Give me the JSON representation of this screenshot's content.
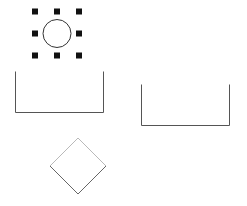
{
  "canvas": {
    "width": 247,
    "height": 206,
    "background_color": "#ffffff",
    "label": "drawing-canvas"
  },
  "colors": {
    "shape_stroke": "#555555",
    "circle_stroke": "#333333",
    "handle_fill": "#111111",
    "diamond_stroke_dark": "#666666",
    "diamond_stroke_light": "#b9b9b9"
  },
  "shapes": [
    {
      "id": "circle-selected",
      "name": "circle-shape",
      "type": "circle",
      "selected": true,
      "cx": 57,
      "cy": 33.5,
      "r": 14,
      "stroke": "#333333",
      "stroke_width": 1,
      "fill": "none"
    },
    {
      "id": "u-shape-left",
      "name": "open-top-rectangle-left",
      "type": "polyline",
      "selected": false,
      "points": "15.5,71.5 15.5,112.5 103.5,112.5 103.5,71.5",
      "stroke": "#555555",
      "stroke_width": 1,
      "fill": "none"
    },
    {
      "id": "u-shape-right",
      "name": "open-top-rectangle-right",
      "type": "polyline",
      "selected": false,
      "points": "141.5,84.5 141.5,125.5 229.5,125.5 229.5,84.5",
      "stroke": "#555555",
      "stroke_width": 1,
      "fill": "none"
    },
    {
      "id": "diamond",
      "name": "diamond-shape",
      "type": "polygon",
      "selected": false,
      "cx": 78,
      "cy": 166,
      "half_diagonal": 28,
      "rotation_deg": 45,
      "points": "78,138 106,166 78,194 50,166",
      "stroke_dark_path": "M 106,166 L 78,194 L 50,166",
      "stroke_light_path": "M 50,166 L 78,138 L 106,166",
      "stroke_width": 1,
      "fill": "none"
    }
  ],
  "selection": {
    "name": "selection-handles",
    "visible": true,
    "handle_size": 6,
    "handle_fill": "#111111",
    "bbox": {
      "x": 42,
      "y": 18.5,
      "width": 30,
      "height": 30
    },
    "handles": [
      {
        "name": "handle-top-left",
        "cx": 35,
        "cy": 11.5,
        "position": "top-left"
      },
      {
        "name": "handle-top-center",
        "cx": 57,
        "cy": 11.5,
        "position": "top-center"
      },
      {
        "name": "handle-top-right",
        "cx": 79,
        "cy": 11.5,
        "position": "top-right"
      },
      {
        "name": "handle-middle-left",
        "cx": 35,
        "cy": 33.5,
        "position": "middle-left"
      },
      {
        "name": "handle-middle-right",
        "cx": 79,
        "cy": 33.5,
        "position": "middle-right"
      },
      {
        "name": "handle-bottom-left",
        "cx": 35,
        "cy": 55.5,
        "position": "bottom-left"
      },
      {
        "name": "handle-bottom-center",
        "cx": 57,
        "cy": 55.5,
        "position": "bottom-center"
      },
      {
        "name": "handle-bottom-right",
        "cx": 79,
        "cy": 55.5,
        "position": "bottom-right"
      }
    ]
  }
}
